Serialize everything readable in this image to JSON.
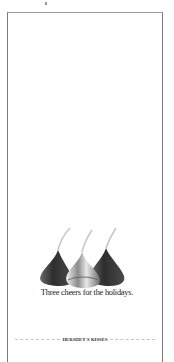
{
  "ad": {
    "tagline": "Three cheers for the holidays.",
    "brand": "HERSHEY'S KISSES",
    "illustration": {
      "subject": "three-chocolate-kisses",
      "count": 3,
      "center_item": "silver-foil-wrapped-kiss"
    },
    "colors": {
      "background": "#ffffff",
      "frame": "#7a7a7a",
      "chocolate": "#3a3a3a",
      "foil": "#d8d8d8",
      "text": "#1a1a1a"
    }
  }
}
